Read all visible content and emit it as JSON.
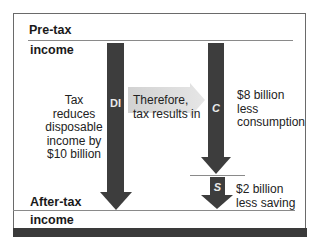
{
  "diagram": {
    "top_label": {
      "line1": "Pre-tax",
      "line2": "income"
    },
    "bottom_label": {
      "line1": "After-tax",
      "line2": "income"
    },
    "left_note": [
      "Tax reduces",
      "disposable",
      "income by",
      "$10 billion"
    ],
    "middle_note": [
      "Therefore,",
      "tax results in"
    ],
    "arrows": [
      {
        "id": "DI",
        "label": "DI",
        "meaning": "disposable income"
      },
      {
        "id": "C",
        "label": "C",
        "meaning": "consumption"
      },
      {
        "id": "S",
        "label": "S",
        "meaning": "saving"
      }
    ],
    "consumption_note": [
      "$8 billion",
      "less",
      "consumption"
    ],
    "saving_note": [
      "$2 billion",
      "less saving"
    ],
    "colors": {
      "arrow": "#3d3d3d",
      "pointer_arrow": "#d9d9d9",
      "frame": "#6a6a6a",
      "bottom_bar": "#3a3a3a"
    }
  }
}
